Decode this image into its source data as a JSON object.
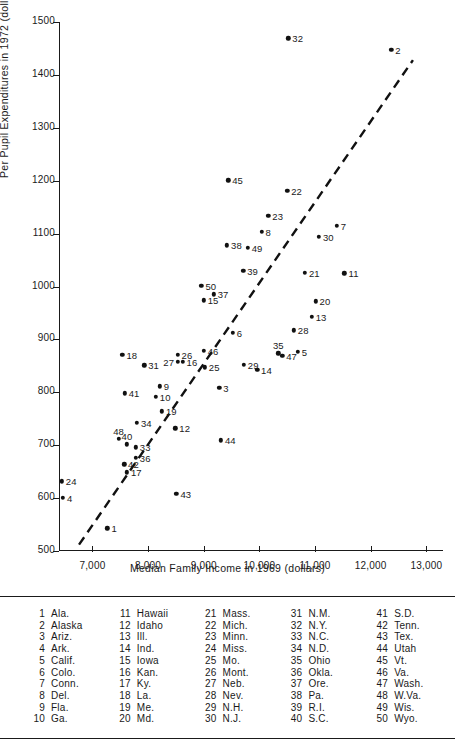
{
  "chart_data": {
    "type": "scatter",
    "title": "",
    "xlabel": "Median Family Income in 1969 (dollars)",
    "ylabel": "Per Pupil Expenditures in 1972 (dollars)",
    "xlim": [
      6400,
      13300
    ],
    "ylim": [
      500,
      1500
    ],
    "xticks": [
      7000,
      8000,
      9000,
      10000,
      11000,
      12000,
      13000
    ],
    "xtick_labels": [
      "7,000",
      "8,000",
      "9,000",
      "10,000",
      "11,000",
      "12,000",
      "13,000"
    ],
    "yticks": [
      500,
      600,
      700,
      800,
      900,
      1000,
      1100,
      1200,
      1300,
      1400,
      1500
    ],
    "ytick_labels": [
      "500",
      "600",
      "700",
      "800",
      "900",
      "1000",
      "1100",
      "1200",
      "1300",
      "1400",
      "1500"
    ],
    "grid": false,
    "legend_position": "below-plot",
    "trendline": {
      "style": "dashed",
      "x0": 6760,
      "y0": 512,
      "x1": 12760,
      "y1": 1428
    },
    "points": [
      {
        "id": 1,
        "state": "Ala.",
        "x": 7270,
        "y": 543,
        "label_side": "right"
      },
      {
        "id": 2,
        "state": "Alaska",
        "x": 12370,
        "y": 1447,
        "label_side": "right"
      },
      {
        "id": 3,
        "state": "Ariz.",
        "x": 9280,
        "y": 808,
        "label_side": "right"
      },
      {
        "id": 4,
        "state": "Ark.",
        "x": 6470,
        "y": 601,
        "label_side": "right"
      },
      {
        "id": 5,
        "state": "Calif.",
        "x": 10690,
        "y": 877,
        "label_side": "right"
      },
      {
        "id": 6,
        "state": "Colo.",
        "x": 9520,
        "y": 912,
        "label_side": "right"
      },
      {
        "id": 7,
        "state": "Conn.",
        "x": 11390,
        "y": 1115,
        "label_side": "right"
      },
      {
        "id": 8,
        "state": "Del.",
        "x": 10040,
        "y": 1103,
        "label_side": "right"
      },
      {
        "id": 9,
        "state": "Fla.",
        "x": 8210,
        "y": 811,
        "label_side": "right"
      },
      {
        "id": 10,
        "state": "Ga.",
        "x": 8140,
        "y": 792,
        "label_side": "right"
      },
      {
        "id": 11,
        "state": "Hawaii",
        "x": 11530,
        "y": 1025,
        "label_side": "right"
      },
      {
        "id": 12,
        "state": "Idaho",
        "x": 8490,
        "y": 732,
        "label_side": "right"
      },
      {
        "id": 13,
        "state": "Ill.",
        "x": 10940,
        "y": 943,
        "label_side": "right"
      },
      {
        "id": 14,
        "state": "Ind.",
        "x": 9960,
        "y": 843,
        "label_side": "right"
      },
      {
        "id": 15,
        "state": "Iowa",
        "x": 9000,
        "y": 974,
        "label_side": "right"
      },
      {
        "id": 16,
        "state": "Kan.",
        "x": 8620,
        "y": 858,
        "label_side": "right"
      },
      {
        "id": 17,
        "state": "Ky.",
        "x": 7620,
        "y": 649,
        "label_side": "right"
      },
      {
        "id": 18,
        "state": "La.",
        "x": 7540,
        "y": 871,
        "label_side": "right"
      },
      {
        "id": 19,
        "state": "Me.",
        "x": 8250,
        "y": 764,
        "label_side": "right"
      },
      {
        "id": 20,
        "state": "Md.",
        "x": 11010,
        "y": 972,
        "label_side": "right"
      },
      {
        "id": 21,
        "state": "Mass.",
        "x": 10820,
        "y": 1026,
        "label_side": "right"
      },
      {
        "id": 22,
        "state": "Mich.",
        "x": 10500,
        "y": 1181,
        "label_side": "right"
      },
      {
        "id": 23,
        "state": "Minn.",
        "x": 10160,
        "y": 1134,
        "label_side": "right"
      },
      {
        "id": 24,
        "state": "Miss.",
        "x": 6450,
        "y": 632,
        "label_side": "right"
      },
      {
        "id": 25,
        "state": "Mo.",
        "x": 9020,
        "y": 847,
        "label_side": "right"
      },
      {
        "id": 26,
        "state": "Mont.",
        "x": 8530,
        "y": 871,
        "label_side": "right"
      },
      {
        "id": 27,
        "state": "Neb.",
        "x": 8540,
        "y": 858,
        "label_side": "left"
      },
      {
        "id": 28,
        "state": "Nev.",
        "x": 10620,
        "y": 917,
        "label_side": "right"
      },
      {
        "id": 29,
        "state": "N.H.",
        "x": 9720,
        "y": 852,
        "label_side": "right"
      },
      {
        "id": 30,
        "state": "N.J.",
        "x": 11070,
        "y": 1094,
        "label_side": "right"
      },
      {
        "id": 31,
        "state": "N.M.",
        "x": 7930,
        "y": 851,
        "label_side": "right"
      },
      {
        "id": 32,
        "state": "N.Y.",
        "x": 10520,
        "y": 1469,
        "label_side": "right"
      },
      {
        "id": 33,
        "state": "N.C.",
        "x": 7780,
        "y": 696,
        "label_side": "right"
      },
      {
        "id": 34,
        "state": "N.D.",
        "x": 7800,
        "y": 742,
        "label_side": "right"
      },
      {
        "id": 35,
        "state": "Ohio",
        "x": 10340,
        "y": 874,
        "label_side": "above"
      },
      {
        "id": 36,
        "state": "Okla.",
        "x": 7780,
        "y": 676,
        "label_side": "right"
      },
      {
        "id": 37,
        "state": "Ore.",
        "x": 9180,
        "y": 985,
        "label_side": "right"
      },
      {
        "id": 38,
        "state": "Pa.",
        "x": 9420,
        "y": 1078,
        "label_side": "right"
      },
      {
        "id": 39,
        "state": "R.I.",
        "x": 9710,
        "y": 1030,
        "label_side": "right"
      },
      {
        "id": 40,
        "state": "S.C.",
        "x": 7620,
        "y": 702,
        "label_side": "above"
      },
      {
        "id": 41,
        "state": "S.D.",
        "x": 7580,
        "y": 798,
        "label_side": "right"
      },
      {
        "id": 42,
        "state": "Tenn.",
        "x": 7570,
        "y": 664,
        "label_side": "right"
      },
      {
        "id": 43,
        "state": "Tex.",
        "x": 8510,
        "y": 608,
        "label_side": "right"
      },
      {
        "id": 44,
        "state": "Utah",
        "x": 9310,
        "y": 709,
        "label_side": "right"
      },
      {
        "id": 45,
        "state": "Vt.",
        "x": 9440,
        "y": 1201,
        "label_side": "right"
      },
      {
        "id": 46,
        "state": "Va.",
        "x": 9000,
        "y": 879,
        "label_side": "right"
      },
      {
        "id": 47,
        "state": "Wash.",
        "x": 10410,
        "y": 869,
        "label_side": "right"
      },
      {
        "id": 48,
        "state": "W.Va.",
        "x": 7470,
        "y": 712,
        "label_side": "above"
      },
      {
        "id": 49,
        "state": "Wis.",
        "x": 9790,
        "y": 1073,
        "label_side": "right"
      },
      {
        "id": 50,
        "state": "Wyo.",
        "x": 8960,
        "y": 1001,
        "label_side": "right"
      }
    ]
  },
  "key": {
    "columns": [
      [
        {
          "num": "1",
          "name": "Ala."
        },
        {
          "num": "2",
          "name": "Alaska"
        },
        {
          "num": "3",
          "name": "Ariz."
        },
        {
          "num": "4",
          "name": "Ark."
        },
        {
          "num": "5",
          "name": "Calif."
        },
        {
          "num": "6",
          "name": "Colo."
        },
        {
          "num": "7",
          "name": "Conn."
        },
        {
          "num": "8",
          "name": "Del."
        },
        {
          "num": "9",
          "name": "Fla."
        },
        {
          "num": "10",
          "name": "Ga."
        }
      ],
      [
        {
          "num": "11",
          "name": "Hawaii"
        },
        {
          "num": "12",
          "name": "Idaho"
        },
        {
          "num": "13",
          "name": "Ill."
        },
        {
          "num": "14",
          "name": "Ind."
        },
        {
          "num": "15",
          "name": "Iowa"
        },
        {
          "num": "16",
          "name": "Kan."
        },
        {
          "num": "17",
          "name": "Ky."
        },
        {
          "num": "18",
          "name": "La."
        },
        {
          "num": "19",
          "name": "Me."
        },
        {
          "num": "20",
          "name": "Md."
        }
      ],
      [
        {
          "num": "21",
          "name": "Mass."
        },
        {
          "num": "22",
          "name": "Mich."
        },
        {
          "num": "23",
          "name": "Minn."
        },
        {
          "num": "24",
          "name": "Miss."
        },
        {
          "num": "25",
          "name": "Mo."
        },
        {
          "num": "26",
          "name": "Mont."
        },
        {
          "num": "27",
          "name": "Neb."
        },
        {
          "num": "28",
          "name": "Nev."
        },
        {
          "num": "29",
          "name": "N.H."
        },
        {
          "num": "30",
          "name": "N.J."
        }
      ],
      [
        {
          "num": "31",
          "name": "N.M."
        },
        {
          "num": "32",
          "name": "N.Y."
        },
        {
          "num": "33",
          "name": "N.C."
        },
        {
          "num": "34",
          "name": "N.D."
        },
        {
          "num": "35",
          "name": "Ohio"
        },
        {
          "num": "36",
          "name": "Okla."
        },
        {
          "num": "37",
          "name": "Ore."
        },
        {
          "num": "38",
          "name": "Pa."
        },
        {
          "num": "39",
          "name": "R.I."
        },
        {
          "num": "40",
          "name": "S.C."
        }
      ],
      [
        {
          "num": "41",
          "name": "S.D."
        },
        {
          "num": "42",
          "name": "Tenn."
        },
        {
          "num": "43",
          "name": "Tex."
        },
        {
          "num": "44",
          "name": "Utah"
        },
        {
          "num": "45",
          "name": "Vt."
        },
        {
          "num": "46",
          "name": "Va."
        },
        {
          "num": "47",
          "name": "Wash."
        },
        {
          "num": "48",
          "name": "W.Va."
        },
        {
          "num": "49",
          "name": "Wis."
        },
        {
          "num": "50",
          "name": "Wyo."
        }
      ]
    ]
  }
}
